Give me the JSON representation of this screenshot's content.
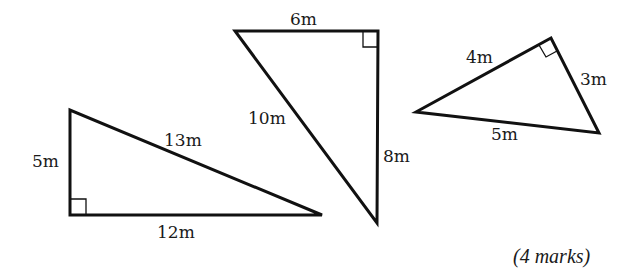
{
  "diagram": {
    "type": "right-triangles",
    "triangles": [
      {
        "id": "triangle-a",
        "vertices": [
          [
            70,
            110
          ],
          [
            70,
            215
          ],
          [
            322,
            215
          ]
        ],
        "right_angle_at": [
          70,
          215
        ],
        "sides": {
          "vertical": "5m",
          "horizontal": "12m",
          "hypotenuse": "13m"
        }
      },
      {
        "id": "triangle-b",
        "vertices": [
          [
            235,
            31
          ],
          [
            378,
            31
          ],
          [
            377,
            223
          ]
        ],
        "right_angle_at": [
          378,
          31
        ],
        "sides": {
          "top": "6m",
          "vertical": "8m",
          "hypotenuse": "10m"
        }
      },
      {
        "id": "triangle-c",
        "vertices": [
          [
            416,
            112
          ],
          [
            551,
            38
          ],
          [
            599,
            133
          ]
        ],
        "right_angle_at": [
          551,
          38
        ],
        "sides": {
          "upper_left": "4m",
          "right": "3m",
          "bottom": "5m"
        }
      }
    ],
    "labels": {
      "a_vertical": "5m",
      "a_horizontal": "12m",
      "a_hypotenuse": "13m",
      "b_top": "6m",
      "b_vertical": "8m",
      "b_hypotenuse": "10m",
      "c_upper": "4m",
      "c_right": "3m",
      "c_bottom": "5m"
    },
    "marks": "(4 marks)"
  }
}
